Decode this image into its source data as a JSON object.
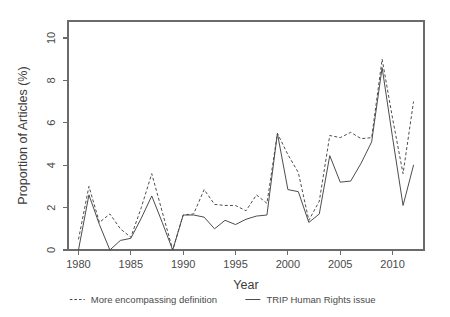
{
  "chart_data": {
    "type": "line",
    "title": "",
    "xlabel": "Year",
    "ylabel": "Proportion of Articles (%)",
    "xlim": [
      1979,
      2013
    ],
    "ylim": [
      0,
      10.8
    ],
    "grid": false,
    "legend_position": "bottom",
    "x_ticks": [
      "1980",
      "1985",
      "1990",
      "1995",
      "2000",
      "2005",
      "2010"
    ],
    "x_tick_values": [
      1980,
      1985,
      1990,
      1995,
      2000,
      2005,
      2010
    ],
    "y_ticks": [
      "0",
      "2",
      "4",
      "6",
      "8",
      "10"
    ],
    "y_tick_values": [
      0,
      2,
      4,
      6,
      8,
      10
    ],
    "x": [
      1980,
      1981,
      1982,
      1983,
      1984,
      1985,
      1986,
      1987,
      1988,
      1989,
      1990,
      1991,
      1992,
      1993,
      1994,
      1995,
      1996,
      1997,
      1998,
      1999,
      2000,
      2001,
      2002,
      2003,
      2004,
      2005,
      2006,
      2007,
      2008,
      2009,
      2010,
      2011,
      2012
    ],
    "series": [
      {
        "name": "More encompassing definition",
        "style": "dashed",
        "color": "#4d4d4d",
        "values": [
          0.5,
          3.0,
          1.3,
          1.7,
          1.0,
          0.6,
          2.0,
          3.6,
          1.8,
          0.0,
          1.65,
          1.7,
          2.85,
          2.15,
          2.1,
          2.1,
          1.85,
          2.6,
          2.2,
          5.5,
          4.5,
          3.65,
          1.4,
          2.3,
          5.4,
          5.3,
          5.55,
          5.25,
          5.3,
          9.0,
          6.2,
          3.6,
          7.0
        ]
      },
      {
        "name": "TRIP Human Rights issue",
        "style": "solid",
        "color": "#4d4d4d",
        "values": [
          0.0,
          2.6,
          1.2,
          0.0,
          0.45,
          0.55,
          1.5,
          2.55,
          1.3,
          0.0,
          1.65,
          1.65,
          1.55,
          1.0,
          1.4,
          1.2,
          1.45,
          1.6,
          1.65,
          5.5,
          2.85,
          2.75,
          1.3,
          1.7,
          4.45,
          3.2,
          3.25,
          4.1,
          5.1,
          8.6,
          5.3,
          2.1,
          4.0
        ]
      }
    ],
    "legend": [
      {
        "label": "More encompassing definition",
        "style": "dashed"
      },
      {
        "label": "TRIP Human Rights issue",
        "style": "solid"
      }
    ]
  }
}
